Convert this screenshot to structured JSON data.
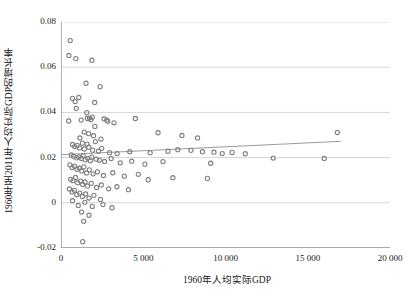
{
  "chart_data": {
    "type": "scatter",
    "title": "",
    "xlabel": "1960年人均实际GDP",
    "ylabel": "1960年至2011年人均实际GDP的增长率",
    "xlim": [
      0,
      20000
    ],
    "ylim": [
      -0.02,
      0.08
    ],
    "xticks": [
      0,
      5000,
      10000,
      15000,
      20000
    ],
    "xticklabels": [
      "0",
      "5 000",
      "10 000",
      "15 000",
      "20 000"
    ],
    "yticks": [
      -0.02,
      0,
      0.02,
      0.04,
      0.06,
      0.08
    ],
    "yticklabels": [
      "-0.02",
      "0",
      "0.02",
      "0.04",
      "0.06",
      "0.08"
    ],
    "grid": "horizontal",
    "legend": "none",
    "marker_color": "#808080",
    "marker_size": 3.0,
    "trendline": {
      "name": "回归线",
      "color": "#9a9a9a",
      "x_start": 0,
      "x_end": 17000,
      "y_start": 0.0213,
      "y_end": 0.0272
    },
    "points": [
      [
        560,
        0.0718
      ],
      [
        480,
        0.0652
      ],
      [
        900,
        0.0638
      ],
      [
        1880,
        0.0631
      ],
      [
        1520,
        0.0529
      ],
      [
        2380,
        0.0514
      ],
      [
        700,
        0.0462
      ],
      [
        1080,
        0.0466
      ],
      [
        860,
        0.0448
      ],
      [
        2050,
        0.0444
      ],
      [
        930,
        0.0418
      ],
      [
        1570,
        0.0399
      ],
      [
        470,
        0.0362
      ],
      [
        1220,
        0.0366
      ],
      [
        1600,
        0.0373
      ],
      [
        1730,
        0.0375
      ],
      [
        1820,
        0.0368
      ],
      [
        1900,
        0.0379
      ],
      [
        2620,
        0.0371
      ],
      [
        2780,
        0.0366
      ],
      [
        2840,
        0.0361
      ],
      [
        3220,
        0.0354
      ],
      [
        4520,
        0.0373
      ],
      [
        2060,
        0.0338
      ],
      [
        1410,
        0.0313
      ],
      [
        1680,
        0.0306
      ],
      [
        1980,
        0.0297
      ],
      [
        1150,
        0.0287
      ],
      [
        2090,
        0.0271
      ],
      [
        2430,
        0.0282
      ],
      [
        5900,
        0.031
      ],
      [
        7350,
        0.0298
      ],
      [
        8300,
        0.0287
      ],
      [
        16800,
        0.0311
      ],
      [
        1300,
        0.0264
      ],
      [
        1580,
        0.026
      ],
      [
        700,
        0.0258
      ],
      [
        830,
        0.0249
      ],
      [
        980,
        0.0254
      ],
      [
        1130,
        0.0243
      ],
      [
        1420,
        0.0238
      ],
      [
        1690,
        0.0246
      ],
      [
        1920,
        0.0233
      ],
      [
        2280,
        0.0228
      ],
      [
        2470,
        0.0241
      ],
      [
        2950,
        0.0222
      ],
      [
        3410,
        0.0218
      ],
      [
        4180,
        0.0226
      ],
      [
        5420,
        0.0221
      ],
      [
        6500,
        0.0228
      ],
      [
        7100,
        0.0235
      ],
      [
        7900,
        0.0232
      ],
      [
        8600,
        0.0226
      ],
      [
        9300,
        0.0224
      ],
      [
        9800,
        0.0218
      ],
      [
        10400,
        0.0223
      ],
      [
        11200,
        0.0217
      ],
      [
        620,
        0.0212
      ],
      [
        760,
        0.0206
      ],
      [
        950,
        0.0199
      ],
      [
        1090,
        0.0203
      ],
      [
        1240,
        0.0196
      ],
      [
        1350,
        0.0208
      ],
      [
        1480,
        0.0191
      ],
      [
        1620,
        0.0197
      ],
      [
        1780,
        0.0186
      ],
      [
        1870,
        0.0202
      ],
      [
        2140,
        0.0193
      ],
      [
        2330,
        0.0188
      ],
      [
        2650,
        0.0183
      ],
      [
        3050,
        0.0196
      ],
      [
        3600,
        0.0177
      ],
      [
        4300,
        0.0184
      ],
      [
        5100,
        0.0171
      ],
      [
        6200,
        0.0182
      ],
      [
        9100,
        0.0175
      ],
      [
        12900,
        0.0198
      ],
      [
        16000,
        0.0196
      ],
      [
        540,
        0.0168
      ],
      [
        680,
        0.0156
      ],
      [
        820,
        0.0162
      ],
      [
        970,
        0.0148
      ],
      [
        1110,
        0.0153
      ],
      [
        1260,
        0.0141
      ],
      [
        1390,
        0.0159
      ],
      [
        1550,
        0.0132
      ],
      [
        1720,
        0.0146
      ],
      [
        1950,
        0.0128
      ],
      [
        2210,
        0.0137
      ],
      [
        2580,
        0.0121
      ],
      [
        3150,
        0.0133
      ],
      [
        3850,
        0.0118
      ],
      [
        4700,
        0.0126
      ],
      [
        6800,
        0.0111
      ],
      [
        8900,
        0.0108
      ],
      [
        590,
        0.0104
      ],
      [
        730,
        0.0098
      ],
      [
        880,
        0.0112
      ],
      [
        1020,
        0.0089
      ],
      [
        1180,
        0.0096
      ],
      [
        1320,
        0.0081
      ],
      [
        1460,
        0.0092
      ],
      [
        1610,
        0.0074
      ],
      [
        1840,
        0.0086
      ],
      [
        2160,
        0.0068
      ],
      [
        2450,
        0.0079
      ],
      [
        2900,
        0.0062
      ],
      [
        3400,
        0.0071
      ],
      [
        4100,
        0.0058
      ],
      [
        5300,
        0.0102
      ],
      [
        510,
        0.0061
      ],
      [
        670,
        0.0048
      ],
      [
        810,
        0.0055
      ],
      [
        960,
        0.0036
      ],
      [
        1140,
        0.0043
      ],
      [
        1300,
        0.0028
      ],
      [
        1500,
        0.0039
      ],
      [
        1700,
        0.0021
      ],
      [
        2000,
        0.0033
      ],
      [
        2400,
        0.0015
      ],
      [
        700,
        0.0009
      ],
      [
        1050,
        -0.0012
      ],
      [
        1450,
        0.0002
      ],
      [
        1900,
        -0.0016
      ],
      [
        2550,
        -0.0008
      ],
      [
        3100,
        -0.0022
      ],
      [
        1250,
        -0.0041
      ],
      [
        1700,
        -0.0055
      ],
      [
        1380,
        -0.0082
      ],
      [
        1320,
        -0.0172
      ]
    ]
  }
}
